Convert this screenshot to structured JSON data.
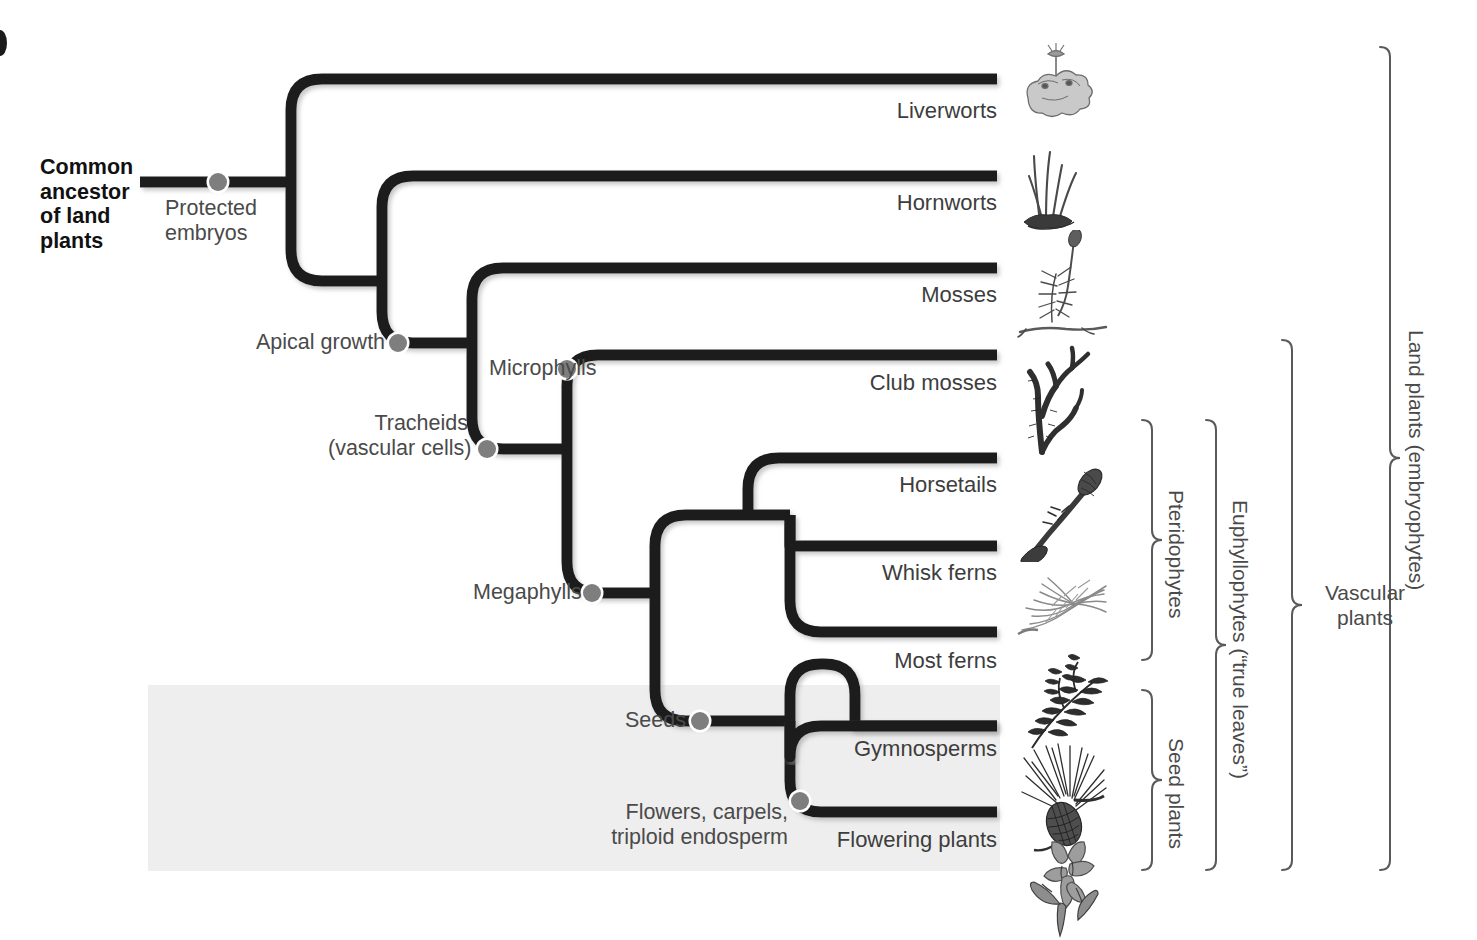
{
  "figure": {
    "type": "phylogenetic-tree",
    "background_color": "#ffffff",
    "branch_color": "#1a1a1a",
    "node_color": "#808080",
    "text_color": "#4a4a4a",
    "shaded_band_color": "#eeeeee"
  },
  "root": {
    "label": "Common\nancestor\nof land\nplants"
  },
  "synapomorphies": [
    {
      "id": "protected-embryos",
      "label": "Protected\nembryos",
      "x": 218,
      "y": 182,
      "label_x": 165,
      "label_y": 196,
      "align": "left"
    },
    {
      "id": "apical-growth",
      "label": "Apical growth",
      "x": 398,
      "y": 343,
      "label_x": 256,
      "label_y": 330,
      "align": "left"
    },
    {
      "id": "tracheids",
      "label": "Tracheids\n(vascular cells)",
      "x": 487,
      "y": 449,
      "label_x": 328,
      "label_y": 411,
      "align": "right"
    },
    {
      "id": "microphylls",
      "label": "Microphylls",
      "x": 567,
      "y": 369,
      "label_x": 489,
      "label_y": 356,
      "align": "left"
    },
    {
      "id": "megaphylls",
      "label": "Megaphylls",
      "x": 592,
      "y": 593,
      "label_x": 473,
      "label_y": 580,
      "align": "left"
    },
    {
      "id": "seeds",
      "label": "Seeds",
      "x": 700,
      "y": 721,
      "label_x": 625,
      "label_y": 708,
      "align": "left"
    },
    {
      "id": "flowers",
      "label": "Flowers, carpels,\ntriploid endosperm",
      "x": 800,
      "y": 801,
      "label_x": 628,
      "label_y": 800,
      "align": "right"
    }
  ],
  "taxa": [
    {
      "id": "liverworts",
      "label": "Liverworts",
      "tip_y": 79,
      "label_y": 98
    },
    {
      "id": "hornworts",
      "label": "Hornworts",
      "tip_y": 176,
      "label_y": 190
    },
    {
      "id": "mosses",
      "label": "Mosses",
      "tip_y": 268,
      "label_y": 282
    },
    {
      "id": "club-mosses",
      "label": "Club mosses",
      "tip_y": 355,
      "label_y": 370
    },
    {
      "id": "horsetails",
      "label": "Horsetails",
      "tip_y": 458,
      "label_y": 472
    },
    {
      "id": "whisk-ferns",
      "label": "Whisk ferns",
      "tip_y": 546,
      "label_y": 560
    },
    {
      "id": "most-ferns",
      "label": "Most ferns",
      "tip_y": 632,
      "label_y": 648
    },
    {
      "id": "gymnosperms",
      "label": "Gymnosperms",
      "tip_y": 726,
      "label_y": 736
    },
    {
      "id": "flowering-plants",
      "label": "Flowering plants",
      "tip_y": 812,
      "label_y": 827
    }
  ],
  "clade_brackets": [
    {
      "id": "pteridophytes",
      "label": "Pteridophytes",
      "x": 1152,
      "top": 420,
      "bottom": 660,
      "orientation": "vertical"
    },
    {
      "id": "seed-plants",
      "label": "Seed plants",
      "x": 1152,
      "top": 690,
      "bottom": 870,
      "orientation": "vertical"
    },
    {
      "id": "euphyllophytes",
      "label": "Euphyllophytes (“true leaves”)",
      "x": 1216,
      "top": 420,
      "bottom": 870,
      "orientation": "vertical"
    },
    {
      "id": "vascular-plants",
      "label": "Vascular\nplants",
      "x": 1292,
      "top": 340,
      "bottom": 870,
      "orientation": "horizontal"
    },
    {
      "id": "land-plants",
      "label": "Land plants (embryophytes)",
      "x": 1390,
      "top": 47,
      "bottom": 870,
      "orientation": "vertical"
    }
  ],
  "illustrations": [
    {
      "id": "liverwort-illustration",
      "taxon": "Liverworts"
    },
    {
      "id": "hornwort-illustration",
      "taxon": "Hornworts"
    },
    {
      "id": "moss-illustration",
      "taxon": "Mosses"
    },
    {
      "id": "club-moss-illustration",
      "taxon": "Club mosses"
    },
    {
      "id": "horsetail-illustration",
      "taxon": "Horsetails"
    },
    {
      "id": "whisk-fern-illustration",
      "taxon": "Whisk ferns"
    },
    {
      "id": "fern-illustration",
      "taxon": "Most ferns"
    },
    {
      "id": "gymnosperm-illustration",
      "taxon": "Gymnosperms"
    },
    {
      "id": "flowering-plant-illustration",
      "taxon": "Flowering plants"
    }
  ]
}
